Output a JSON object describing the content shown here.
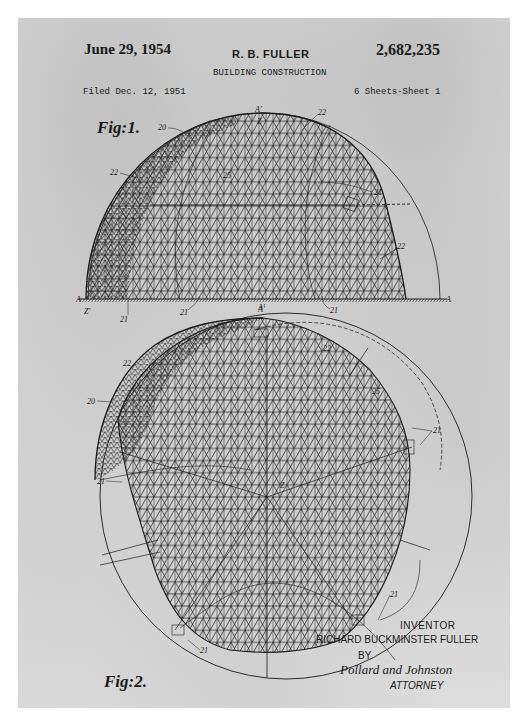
{
  "header": {
    "date": "June 29, 1954",
    "inventor": "R. B. FULLER",
    "patent_number": "2,682,235",
    "subject": "BUILDING CONSTRUCTION",
    "filed": "Filed Dec. 12, 1951",
    "sheets": "6 Sheets-Sheet 1"
  },
  "figures": {
    "fig1": {
      "label": "Fig:1.",
      "refs": [
        "20",
        "22",
        "22",
        "22",
        "25",
        "21",
        "21",
        "21",
        "21",
        "A",
        "A",
        "A'",
        "A'",
        "Z",
        "Z'"
      ]
    },
    "fig2": {
      "label": "Fig:2.",
      "refs": [
        "20",
        "22",
        "22",
        "25",
        "21",
        "21",
        "21",
        "21",
        "A'",
        "Z"
      ]
    }
  },
  "signature": {
    "inventor_label": "INVENTOR",
    "inventor_name": "RICHARD BUCKMINSTER FULLER",
    "by": "BY",
    "attorney_signature": "Pollard and Johnston",
    "attorney_label": "ATTORNEY"
  },
  "colors": {
    "paper": "#dcdcdc",
    "ink": "#1a1a1a"
  }
}
